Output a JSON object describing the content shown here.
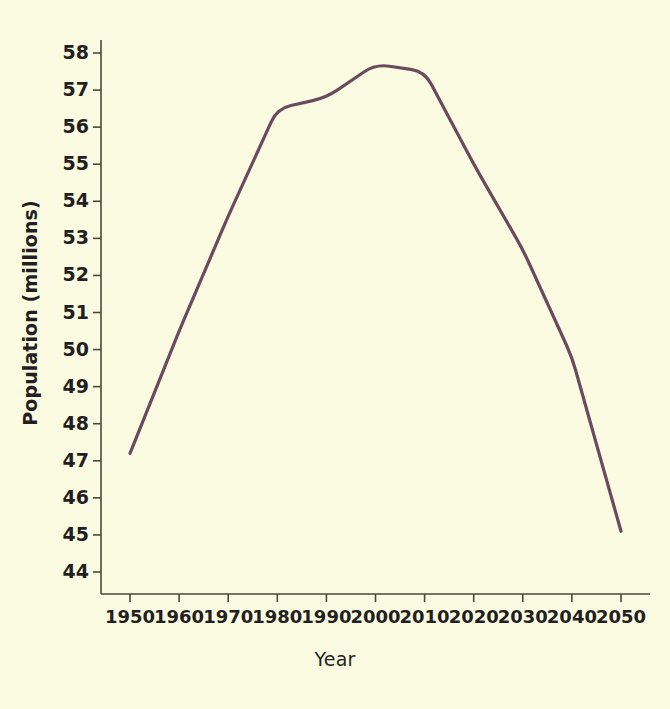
{
  "chart_data": {
    "type": "line",
    "title": "",
    "subtitle": "",
    "xlabel": "Year",
    "ylabel": "Population (millions)",
    "x": [
      1950,
      1960,
      1970,
      1980,
      1990,
      2000,
      2010,
      2020,
      2030,
      2040,
      2050
    ],
    "values": [
      47.2,
      50.5,
      53.6,
      56.5,
      56.8,
      57.7,
      57.5,
      55.0,
      52.7,
      49.8,
      45.1
    ],
    "series": [
      {
        "name": "Population",
        "color": "#6b4a5e",
        "values": [
          47.2,
          50.5,
          53.6,
          56.5,
          56.8,
          57.7,
          57.5,
          55.0,
          52.7,
          49.8,
          45.1
        ]
      }
    ],
    "xtick_labels": [
      "1950",
      "1960",
      "1970",
      "1980",
      "1990",
      "2000",
      "2010",
      "2020",
      "2030",
      "2040",
      "2050"
    ],
    "ytick_labels": [
      "58",
      "57",
      "56",
      "55",
      "54",
      "53",
      "52",
      "51",
      "50",
      "49",
      "48",
      "47",
      "46",
      "45",
      "44"
    ],
    "yticks": [
      58,
      57,
      56,
      55,
      54,
      53,
      52,
      51,
      50,
      49,
      48,
      47,
      46,
      45,
      44
    ],
    "xlim": [
      1945,
      2055
    ],
    "ylim": [
      43.6,
      58.4
    ],
    "grid": false,
    "legend": false,
    "legend_position": "none",
    "background_color": "#fbfbe2",
    "axis_color": "#4a4a3c",
    "text_color": "#231f20",
    "annotations": []
  }
}
